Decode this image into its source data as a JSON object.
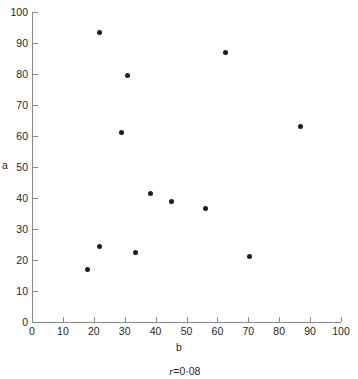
{
  "chart_data": {
    "type": "scatter",
    "title": "",
    "xlabel": "b",
    "ylabel": "a",
    "xlim": [
      0,
      100
    ],
    "ylim": [
      0,
      100
    ],
    "xticks": [
      0,
      10,
      20,
      30,
      40,
      50,
      60,
      70,
      80,
      90,
      100
    ],
    "yticks": [
      0,
      10,
      20,
      30,
      40,
      50,
      60,
      70,
      80,
      90,
      100
    ],
    "grid": false,
    "legend": false,
    "annotation": "r = 0·08",
    "annotation_parts": {
      "symbol": "r",
      "equals": "=",
      "value": "0·08"
    },
    "marker_color": "#1c1c1c",
    "axis_color": "#8a8a8a",
    "points": [
      {
        "x": 22,
        "y": 93.5
      },
      {
        "x": 31,
        "y": 79.5
      },
      {
        "x": 29,
        "y": 61
      },
      {
        "x": 62.5,
        "y": 87
      },
      {
        "x": 87,
        "y": 63
      },
      {
        "x": 38.5,
        "y": 41.5
      },
      {
        "x": 45,
        "y": 39
      },
      {
        "x": 56,
        "y": 36.5
      },
      {
        "x": 22,
        "y": 24.5
      },
      {
        "x": 33.5,
        "y": 22.5
      },
      {
        "x": 70.5,
        "y": 21
      },
      {
        "x": 18,
        "y": 17
      }
    ]
  }
}
